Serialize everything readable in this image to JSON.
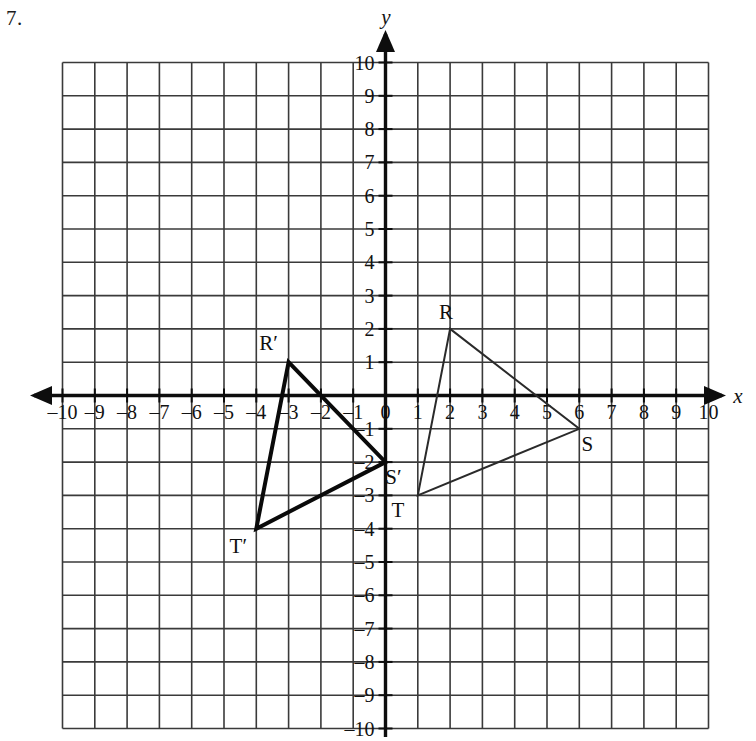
{
  "problem": {
    "number": "7."
  },
  "axes": {
    "x_name": "x",
    "y_name": "y",
    "x_ticks": [
      "–10",
      "–9",
      "–8",
      "–7",
      "–6",
      "–5",
      "–4",
      "–3",
      "–2",
      "–1",
      "0",
      "1",
      "2",
      "3",
      "4",
      "5",
      "6",
      "7",
      "8",
      "9",
      "10"
    ],
    "y_ticks": [
      "10",
      "9",
      "8",
      "7",
      "6",
      "5",
      "4",
      "3",
      "2",
      "1",
      "0",
      "–1",
      "–2",
      "–3",
      "–4",
      "–5",
      "–6",
      "–7",
      "–8",
      "–9",
      "–10"
    ],
    "origin_label": "0",
    "grid_color": "#3a3a3a",
    "axis_color": "#0d0d0d"
  },
  "chart_data": {
    "type": "scatter",
    "title": "",
    "xlabel": "x",
    "ylabel": "y",
    "xlim": [
      -10,
      10
    ],
    "ylim": [
      -10,
      10
    ],
    "grid": true,
    "legend": "none",
    "xticks": [
      -10,
      -9,
      -8,
      -7,
      -6,
      -5,
      -4,
      -3,
      -2,
      -1,
      0,
      1,
      2,
      3,
      4,
      5,
      6,
      7,
      8,
      9,
      10
    ],
    "yticks": [
      -10,
      -9,
      -8,
      -7,
      -6,
      -5,
      -4,
      -3,
      -2,
      -1,
      0,
      1,
      2,
      3,
      4,
      5,
      6,
      7,
      8,
      9,
      10
    ],
    "series": [
      {
        "name": "Triangle RST",
        "type": "polygon",
        "stroke_width": 2,
        "color": "#2a2a2a",
        "points": [
          {
            "label": "R",
            "x": 2,
            "y": 2,
            "label_dx": -4,
            "label_dy": -10
          },
          {
            "label": "S",
            "x": 6,
            "y": -1,
            "label_dx": 8,
            "label_dy": 22
          },
          {
            "label": "T",
            "x": 1,
            "y": -3,
            "label_dx": -20,
            "label_dy": 22
          }
        ]
      },
      {
        "name": "Triangle R'S'T'",
        "type": "polygon",
        "stroke_width": 4,
        "color": "#0a0a0a",
        "points": [
          {
            "label": "R′",
            "x": -3,
            "y": 1,
            "label_dx": -20,
            "label_dy": -12
          },
          {
            "label": "S′",
            "x": 0,
            "y": -2,
            "label_dx": 8,
            "label_dy": 22
          },
          {
            "label": "T′",
            "x": -4,
            "y": -4,
            "label_dx": -18,
            "label_dy": 24
          }
        ]
      }
    ],
    "annotations": [
      {
        "text": "R",
        "x": 2,
        "y": 2
      },
      {
        "text": "S",
        "x": 6,
        "y": -1
      },
      {
        "text": "T",
        "x": 1,
        "y": -3
      },
      {
        "text": "R′",
        "x": -3,
        "y": 1
      },
      {
        "text": "S′",
        "x": 0,
        "y": -2
      },
      {
        "text": "T′",
        "x": -4,
        "y": -4
      }
    ]
  }
}
